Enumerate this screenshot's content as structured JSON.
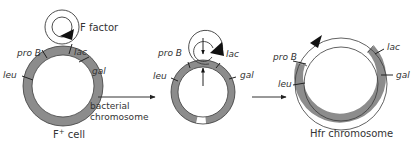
{
  "diagram": {
    "colors": {
      "chromosome": "#8c8c8c",
      "outline": "#3a3a3a",
      "f_factor": "#ffffff",
      "text": "#333333",
      "arrowhead": "#111111"
    },
    "panels": [
      {
        "id": "f-plus-cell",
        "caption": "F",
        "caption_sup": "+",
        "caption_rest": " cell",
        "f_factor_label": "F factor",
        "side_label_line1": "bacterial",
        "side_label_line2": "chromosome",
        "genes": [
          "pro B",
          "lac",
          "leu",
          "gal"
        ]
      },
      {
        "id": "integration",
        "genes": [
          "pro B",
          "lac",
          "leu",
          "gal"
        ]
      },
      {
        "id": "hfr",
        "caption": "Hfr chromosome",
        "genes": [
          "pro B",
          "lac",
          "leu",
          "gal"
        ]
      }
    ]
  }
}
